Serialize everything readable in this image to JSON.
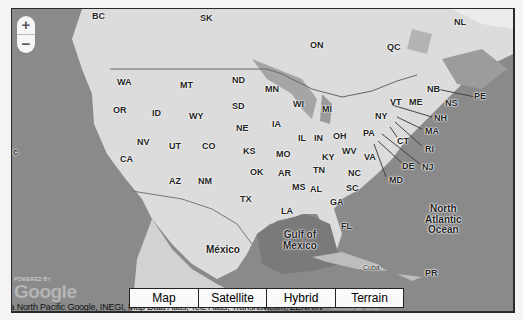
{
  "map": {
    "zoom_in_label": "+",
    "zoom_out_label": "−",
    "map_types": [
      {
        "label": "Map",
        "width": 68,
        "selected": true
      },
      {
        "label": "Satellite",
        "width": 67,
        "selected": false
      },
      {
        "label": "Hybrid",
        "width": 68,
        "selected": false
      },
      {
        "label": "Terrain",
        "width": 67,
        "selected": false
      }
    ],
    "powered_by": "POWERED BY",
    "logo": "Google",
    "attribution": {
      "text": "opa  North Pacific Google, INEGI, Map Data Atlas, Tele Atlas, Transnavicom, ZENRIN - ",
      "terms": "Terms of Use"
    },
    "colors": {
      "water": "#8a8a8a",
      "land": "#dcdcdc",
      "frame": "#2a2a2a"
    },
    "labels": {
      "canada": [
        {
          "text": "BC",
          "x": 80,
          "y": 3
        },
        {
          "text": "SK",
          "x": 188,
          "y": 5
        },
        {
          "text": "ON",
          "x": 298,
          "y": 32
        },
        {
          "text": "QC",
          "x": 375,
          "y": 34
        },
        {
          "text": "NL",
          "x": 442,
          "y": 9
        },
        {
          "text": "NB",
          "x": 415,
          "y": 76
        },
        {
          "text": "NS",
          "x": 433,
          "y": 90
        },
        {
          "text": "PE",
          "x": 462,
          "y": 83
        }
      ],
      "us_states": [
        {
          "text": "WA",
          "x": 105,
          "y": 69
        },
        {
          "text": "MT",
          "x": 168,
          "y": 72
        },
        {
          "text": "ND",
          "x": 220,
          "y": 67
        },
        {
          "text": "MN",
          "x": 253,
          "y": 76
        },
        {
          "text": "OR",
          "x": 101,
          "y": 97
        },
        {
          "text": "ID",
          "x": 140,
          "y": 100
        },
        {
          "text": "WY",
          "x": 177,
          "y": 103
        },
        {
          "text": "SD",
          "x": 220,
          "y": 93
        },
        {
          "text": "WI",
          "x": 281,
          "y": 91
        },
        {
          "text": "MI",
          "x": 310,
          "y": 96
        },
        {
          "text": "NE",
          "x": 224,
          "y": 115
        },
        {
          "text": "IA",
          "x": 260,
          "y": 111
        },
        {
          "text": "NV",
          "x": 125,
          "y": 129
        },
        {
          "text": "UT",
          "x": 157,
          "y": 133
        },
        {
          "text": "CO",
          "x": 190,
          "y": 133
        },
        {
          "text": "KS",
          "x": 231,
          "y": 138
        },
        {
          "text": "IL",
          "x": 286,
          "y": 125
        },
        {
          "text": "IN",
          "x": 302,
          "y": 125
        },
        {
          "text": "OH",
          "x": 321,
          "y": 123
        },
        {
          "text": "PA",
          "x": 351,
          "y": 120
        },
        {
          "text": "NY",
          "x": 363,
          "y": 103
        },
        {
          "text": "VT",
          "x": 378,
          "y": 89
        },
        {
          "text": "ME",
          "x": 397,
          "y": 89
        },
        {
          "text": "NH",
          "x": 422,
          "y": 105
        },
        {
          "text": "MA",
          "x": 413,
          "y": 118
        },
        {
          "text": "CT",
          "x": 385,
          "y": 128
        },
        {
          "text": "RI",
          "x": 413,
          "y": 136
        },
        {
          "text": "CA",
          "x": 108,
          "y": 146
        },
        {
          "text": "MO",
          "x": 264,
          "y": 141
        },
        {
          "text": "KY",
          "x": 310,
          "y": 144
        },
        {
          "text": "WV",
          "x": 330,
          "y": 138
        },
        {
          "text": "VA",
          "x": 352,
          "y": 144
        },
        {
          "text": "DE",
          "x": 390,
          "y": 153
        },
        {
          "text": "NJ",
          "x": 410,
          "y": 154
        },
        {
          "text": "MD",
          "x": 377,
          "y": 167
        },
        {
          "text": "OK",
          "x": 238,
          "y": 159
        },
        {
          "text": "AR",
          "x": 266,
          "y": 160
        },
        {
          "text": "TN",
          "x": 301,
          "y": 157
        },
        {
          "text": "NC",
          "x": 336,
          "y": 160
        },
        {
          "text": "AZ",
          "x": 157,
          "y": 168
        },
        {
          "text": "NM",
          "x": 186,
          "y": 168
        },
        {
          "text": "MS",
          "x": 280,
          "y": 174
        },
        {
          "text": "AL",
          "x": 298,
          "y": 176
        },
        {
          "text": "SC",
          "x": 334,
          "y": 175
        },
        {
          "text": "TX",
          "x": 228,
          "y": 186
        },
        {
          "text": "GA",
          "x": 318,
          "y": 189
        },
        {
          "text": "LA",
          "x": 269,
          "y": 198
        },
        {
          "text": "FL",
          "x": 329,
          "y": 213
        }
      ],
      "regions": [
        {
          "text": "Gulf of\nMexico",
          "x": 271,
          "y": 221,
          "big": true
        },
        {
          "text": "North\nAtlantic\nOcean",
          "x": 413,
          "y": 195,
          "big": true
        },
        {
          "text": "México",
          "x": 194,
          "y": 236,
          "big": true
        },
        {
          "text": "Cuba",
          "x": 351,
          "y": 255,
          "small": true
        },
        {
          "text": "PR",
          "x": 413,
          "y": 260
        },
        {
          "text": "c",
          "x": 1,
          "y": 139
        }
      ]
    }
  }
}
